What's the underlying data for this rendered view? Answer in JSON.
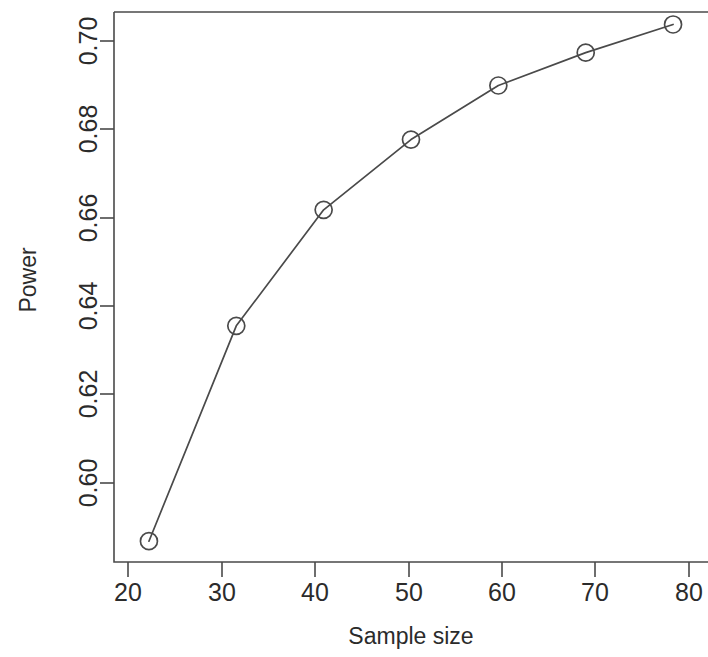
{
  "chart_data": {
    "type": "line",
    "title": "",
    "subtitle": "",
    "xlabel": "Sample size",
    "ylabel": "Power",
    "x": [
      20,
      30,
      40,
      50,
      60,
      70,
      80
    ],
    "values": [
      0.59,
      0.6366,
      0.6617,
      0.6769,
      0.6886,
      0.6957,
      0.7018
    ],
    "series": [
      {
        "name": "Power",
        "values": [
          0.59,
          0.6366,
          0.6617,
          0.6769,
          0.6886,
          0.6957,
          0.7018
        ]
      }
    ],
    "xticks": [
      20,
      30,
      40,
      50,
      60,
      70,
      80
    ],
    "xtick_labels": [
      "20",
      "30",
      "40",
      "50",
      "60",
      "70",
      "80"
    ],
    "yticks": [
      0.6,
      0.62,
      0.64,
      0.66,
      0.68,
      0.7
    ],
    "ytick_labels": [
      "0.60",
      "0.62",
      "0.64",
      "0.66",
      "0.68",
      "0.70"
    ],
    "xlim": [
      16,
      84
    ],
    "ylim": [
      0.5855,
      0.7045
    ],
    "grid": false,
    "legend": false,
    "legend_position": "none",
    "marker": "open-circle",
    "line_color": "#4a4a4a",
    "marker_color": "#4a4a4a",
    "background_color": "#ffffff",
    "annotations": []
  },
  "axes": {
    "y_title": "Power",
    "x_title": "Sample size"
  }
}
